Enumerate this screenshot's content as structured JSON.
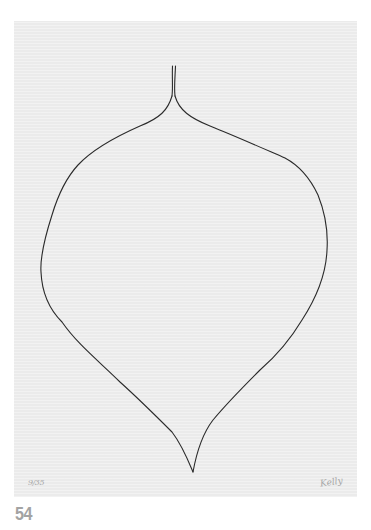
{
  "artwork": {
    "description": "Line drawing of a leaf / onion-like shape with a split stem, on textured paper",
    "paper_color": "#ebebeb",
    "line_color": "#2a2a2a",
    "edition_mark": "9/35",
    "signature": "Kelly"
  },
  "page": {
    "number": "54"
  }
}
